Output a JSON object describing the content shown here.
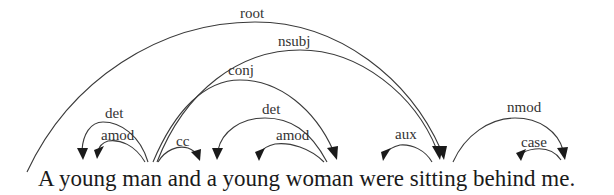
{
  "diagram": {
    "type": "dependency-parse",
    "sentence": "A young man and a young woman were sitting behind me.",
    "tokens": [
      "A",
      "young",
      "man",
      "and",
      "a",
      "young",
      "woman",
      "were",
      "sitting",
      "behind",
      "me."
    ],
    "arcs": [
      {
        "label": "root",
        "head": "ROOT",
        "dependent": "sitting"
      },
      {
        "label": "nsubj",
        "head": "sitting",
        "dependent": "man"
      },
      {
        "label": "conj",
        "head": "man",
        "dependent": "woman"
      },
      {
        "label": "det",
        "head": "man",
        "dependent": "A"
      },
      {
        "label": "amod",
        "head": "man",
        "dependent": "young"
      },
      {
        "label": "cc",
        "head": "man",
        "dependent": "and"
      },
      {
        "label": "det",
        "head": "woman",
        "dependent": "a"
      },
      {
        "label": "amod",
        "head": "woman",
        "dependent": "young"
      },
      {
        "label": "aux",
        "head": "sitting",
        "dependent": "were"
      },
      {
        "label": "nmod",
        "head": "sitting",
        "dependent": "me"
      },
      {
        "label": "case",
        "head": "me",
        "dependent": "behind"
      }
    ],
    "colors": {
      "line": "#3a3a3a",
      "text": "#1a1a1a",
      "background": "#ffffff"
    }
  }
}
